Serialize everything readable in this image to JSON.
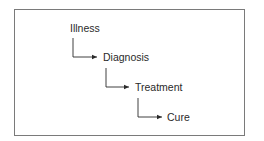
{
  "diagram": {
    "type": "flow",
    "direction": "top-left to bottom-right (stepped)",
    "nodes": [
      {
        "id": "illness",
        "label": "Illness"
      },
      {
        "id": "diagnosis",
        "label": "Diagnosis"
      },
      {
        "id": "treatment",
        "label": "Treatment"
      },
      {
        "id": "cure",
        "label": "Cure"
      }
    ],
    "edges": [
      {
        "from": "illness",
        "to": "diagnosis"
      },
      {
        "from": "diagnosis",
        "to": "treatment"
      },
      {
        "from": "treatment",
        "to": "cure"
      }
    ],
    "colors": {
      "line": "#2a2a2a",
      "frame": "#7a7a7a",
      "text": "#2a2a2a"
    }
  }
}
